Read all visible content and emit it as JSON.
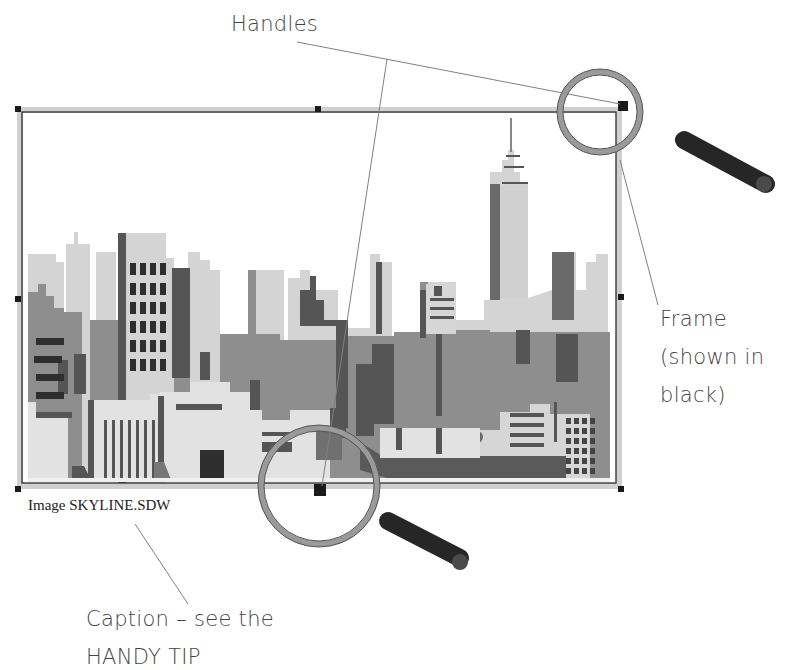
{
  "callouts": {
    "handles": "Handles",
    "frame_line1": "Frame",
    "frame_line2": "(shown in",
    "frame_line3": "black)",
    "caption_line1": "Caption – see the",
    "caption_line2": "HANDY TIP"
  },
  "image_frame": {
    "caption": "Image SKYLINE.SDW",
    "handles_count": 8
  },
  "colors": {
    "frame": "#2a2a2a",
    "frame_border_fill": "#cfcfcf",
    "handle": "#1a1a1a",
    "building_light": "#d4d4d4",
    "building_mid": "#8e8e8e",
    "building_dark": "#5a5a5a",
    "building_darkest": "#333333",
    "magnifier_handle": "#262626",
    "leader_line": "#777777"
  }
}
